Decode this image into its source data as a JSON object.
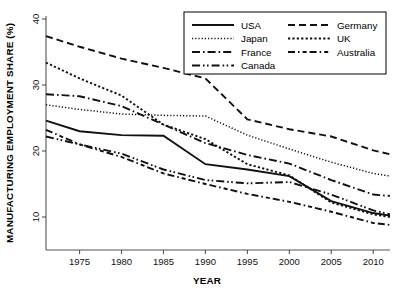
{
  "chart_data": {
    "type": "line",
    "title": "",
    "xlabel": "YEAR",
    "ylabel": "MANUFACTURING EMPLOYMENT SHARE (%)",
    "xlim": [
      1971,
      2012
    ],
    "ylim": [
      6.5,
      40.5
    ],
    "xticks": [
      1975,
      1980,
      1985,
      1990,
      1995,
      2000,
      2005,
      2010
    ],
    "yticks": [
      10,
      20,
      30,
      40
    ],
    "grid": false,
    "legend_position": "top-right",
    "x": [
      1971,
      1975,
      1980,
      1985,
      1990,
      1995,
      2000,
      2005,
      2010,
      2012
    ],
    "series": [
      {
        "name": "USA",
        "dash": "solid",
        "values": [
          24.6,
          23.0,
          22.4,
          22.3,
          18.0,
          17.2,
          16.2,
          12.4,
          10.6,
          10.2
        ]
      },
      {
        "name": "Japan",
        "dash": "dotted-light",
        "values": [
          27.0,
          26.3,
          25.6,
          25.4,
          25.3,
          22.4,
          20.3,
          18.3,
          16.6,
          16.2
        ]
      },
      {
        "name": "France",
        "dash": "dash-dot",
        "values": [
          28.6,
          28.3,
          26.8,
          24.0,
          21.2,
          19.4,
          18.1,
          15.6,
          13.4,
          13.2
        ]
      },
      {
        "name": "Canada",
        "dash": "dash-dot-dot",
        "values": [
          22.2,
          21.0,
          19.6,
          17.2,
          15.6,
          15.1,
          15.3,
          13.4,
          11.0,
          10.4
        ]
      },
      {
        "name": "Germany",
        "dash": "dashed",
        "values": [
          37.4,
          35.8,
          34.0,
          32.6,
          31.0,
          24.8,
          23.3,
          22.2,
          20.1,
          19.5
        ]
      },
      {
        "name": "UK",
        "dash": "dotted-dense",
        "values": [
          33.4,
          31.0,
          28.4,
          24.0,
          21.8,
          18.0,
          16.3,
          12.2,
          10.4,
          10.0
        ]
      },
      {
        "name": "Australia",
        "dash": "dash-dot-dash",
        "values": [
          23.2,
          21.0,
          19.1,
          16.6,
          15.0,
          13.5,
          12.3,
          10.8,
          9.1,
          8.8
        ]
      }
    ]
  },
  "legend": {
    "items": [
      {
        "label": "USA"
      },
      {
        "label": "Japan"
      },
      {
        "label": "France"
      },
      {
        "label": "Canada"
      },
      {
        "label": "Germany"
      },
      {
        "label": "UK"
      },
      {
        "label": "Australia"
      }
    ]
  },
  "axes": {
    "x_title": "YEAR",
    "y_title": "MANUFACTURING EMPLOYMENT SHARE (%)",
    "x_tick_labels": [
      "1975",
      "1980",
      "1985",
      "1990",
      "1995",
      "2000",
      "2005",
      "2010"
    ],
    "y_tick_labels": [
      "10",
      "20",
      "30",
      "40"
    ]
  },
  "colors": {
    "line": "#111111",
    "axis": "#555555",
    "japan_line": "#9a9a9a",
    "background": "#ffffff"
  }
}
